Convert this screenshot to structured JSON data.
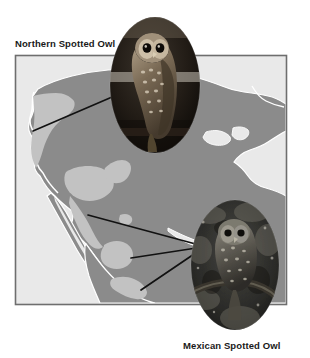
{
  "figure": {
    "title_visible": false,
    "background_color": "#ffffff",
    "labels": {
      "northern": "Northern Spotted Owl",
      "mexican": "Mexican Spotted Owl"
    },
    "map": {
      "name": "north-america-range-map",
      "frame": {
        "x": 15,
        "y": 55,
        "width": 272,
        "height": 250
      },
      "frame_color": "#6e6e6e",
      "ocean_color": "#e9e9e9",
      "land_color": "#8b8b8b",
      "range_color": "#c2c2c2",
      "coast_outline_color": "#ffffff"
    },
    "photos": [
      {
        "name": "northern-spotted-owl-photo",
        "subject": "Northern Spotted Owl",
        "shape": "oval",
        "cx": 155,
        "cy": 85,
        "rx": 45,
        "ry": 68,
        "tone": "dark-brown-monochrome"
      },
      {
        "name": "mexican-spotted-owl-photo",
        "subject": "Mexican Spotted Owl",
        "shape": "oval",
        "cx": 235,
        "cy": 265,
        "rx": 44,
        "ry": 65,
        "tone": "dark-gray-monochrome"
      }
    ],
    "leader_lines": [
      {
        "name": "leader-line-northern",
        "x1": 33,
        "y1": 131,
        "x2": 133,
        "y2": 88
      },
      {
        "name": "leader-line-mexican-1",
        "x1": 88,
        "y1": 215,
        "x2": 203,
        "y2": 246
      },
      {
        "name": "leader-line-mexican-2",
        "x1": 131,
        "y1": 258,
        "x2": 203,
        "y2": 247
      },
      {
        "name": "leader-line-mexican-3",
        "x1": 141,
        "y1": 290,
        "x2": 203,
        "y2": 248
      }
    ],
    "line_color": "#111111"
  }
}
